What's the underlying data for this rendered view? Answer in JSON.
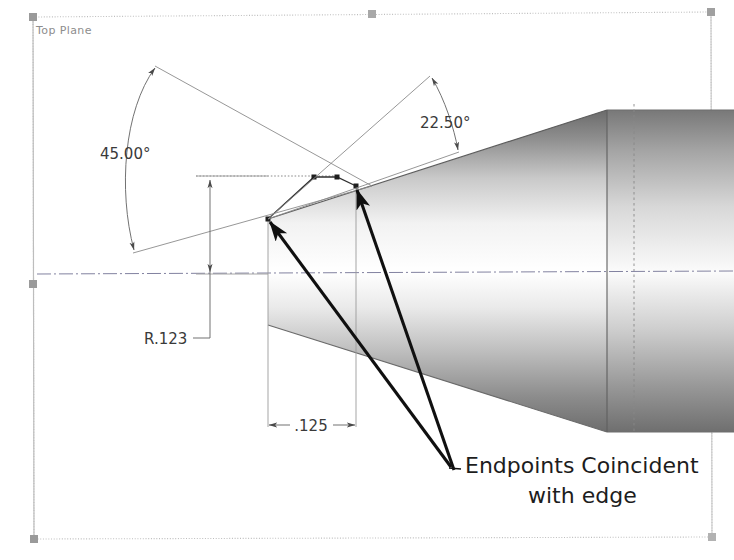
{
  "app": {
    "kind": "cad-sketch-viewport",
    "background_color": "#ffffff"
  },
  "plane": {
    "label": "Top Plane",
    "border_color": "#b9b9b9",
    "handle_color": "#9a9a9a",
    "handles": [
      {
        "name": "plane-handle-top-left",
        "x": 33,
        "y": 17
      },
      {
        "name": "plane-handle-top-center",
        "x": 372,
        "y": 14
      },
      {
        "name": "plane-handle-top-right",
        "x": 711,
        "y": 12
      },
      {
        "name": "plane-handle-mid-left",
        "x": 33,
        "y": 284
      },
      {
        "name": "plane-handle-mid-right",
        "x": 711,
        "y": 283
      },
      {
        "name": "plane-handle-bottom-left",
        "x": 34,
        "y": 539
      },
      {
        "name": "plane-handle-bottom-right",
        "x": 712,
        "y": 537
      }
    ]
  },
  "dimensions": [
    {
      "id": "angle-45",
      "name": "angular-dimension-45",
      "value": "45.00°",
      "type": "angular",
      "text_x": 100,
      "text_y": 159,
      "color": "#4a4a4a"
    },
    {
      "id": "angle-22-5",
      "name": "angular-dimension-22-5",
      "value": "22.50°",
      "type": "angular",
      "text_x": 420,
      "text_y": 128,
      "color": "#4a4a4a"
    },
    {
      "id": "radius-123",
      "name": "radius-dimension-r123",
      "value": "R.123",
      "type": "radial",
      "text_x": 144,
      "text_y": 344,
      "color": "#4a4a4a"
    },
    {
      "id": "length-125",
      "name": "linear-dimension-125",
      "value": ".125",
      "type": "linear",
      "text_x": 296,
      "text_y": 430,
      "color": "#4a4a4a"
    }
  ],
  "annotation": {
    "name": "relation-note",
    "line1": "Endpoints Coincident",
    "line2": "with edge",
    "line1_x": 465,
    "line1_y": 473,
    "line2_x": 528,
    "line2_y": 503,
    "color": "#1d1d1d",
    "leaders": [
      {
        "name": "leader-arrow-upper-endpoint",
        "from_x": 449,
        "from_y": 466,
        "to_x": 268,
        "to_y": 220
      },
      {
        "name": "leader-arrow-lower-endpoint",
        "from_x": 452,
        "from_y": 470,
        "to_x": 355,
        "to_y": 186
      }
    ]
  },
  "model": {
    "name": "revolved-cone-solid",
    "shading": {
      "top_edge_color": "#6f6f6f",
      "highlight_color": "#ffffff",
      "bottom_color": "#707070",
      "seam_color": "#5a5a5a"
    },
    "axis": {
      "name": "centerline-axis",
      "y": 272,
      "color": "#7d7d9a",
      "style": "dash-dot"
    }
  },
  "sketch": {
    "name": "sketch-geometry",
    "entity_color": "#2f2f2f",
    "construction_color": "#8e8e8e",
    "points": [
      {
        "name": "sketch-point-left-endpoint",
        "x": 268,
        "y": 219
      },
      {
        "name": "sketch-point-top-left",
        "x": 314,
        "y": 177
      },
      {
        "name": "sketch-point-top-right",
        "x": 337,
        "y": 177
      },
      {
        "name": "sketch-point-right-endpoint",
        "x": 356,
        "y": 186
      }
    ]
  }
}
